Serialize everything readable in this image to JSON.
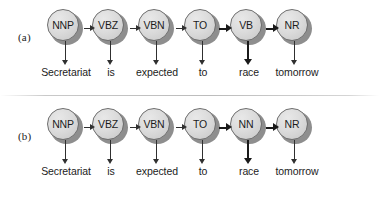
{
  "figure": {
    "background_color": "#ffffff",
    "node_fill_color": "#dcdcdc",
    "node_shadow_color": "#8e8e8e",
    "node_outline_color": "#6e6e6e",
    "arrow_color": "#303030",
    "divider_color": "#bcbcbc"
  },
  "panels": [
    {
      "label": "(a)",
      "nodes": [
        {
          "tag": "NNP",
          "word": "Secretariat",
          "x": 65,
          "word_arrow_bold": false
        },
        {
          "tag": "VBZ",
          "word": "is",
          "x": 110,
          "word_arrow_bold": false
        },
        {
          "tag": "VBN",
          "word": "expected",
          "x": 156,
          "word_arrow_bold": false
        },
        {
          "tag": "TO",
          "word": "to",
          "x": 202,
          "word_arrow_bold": false
        },
        {
          "tag": "VB",
          "word": "race",
          "x": 248,
          "word_arrow_bold": true
        },
        {
          "tag": "NR",
          "word": "tomorrow",
          "x": 294,
          "word_arrow_bold": false
        }
      ],
      "connectors": [
        {
          "from": "NNP",
          "to": "VBZ",
          "bold": false
        },
        {
          "from": "VBZ",
          "to": "VBN",
          "bold": false
        },
        {
          "from": "VBN",
          "to": "TO",
          "bold": false
        },
        {
          "from": "TO",
          "to": "VB",
          "bold": true
        },
        {
          "from": "VB",
          "to": "NR",
          "bold": true
        }
      ]
    },
    {
      "label": "(b)",
      "nodes": [
        {
          "tag": "NNP",
          "word": "Secretariat",
          "x": 65,
          "word_arrow_bold": false
        },
        {
          "tag": "VBZ",
          "word": "is",
          "x": 110,
          "word_arrow_bold": false
        },
        {
          "tag": "VBN",
          "word": "expected",
          "x": 156,
          "word_arrow_bold": false
        },
        {
          "tag": "TO",
          "word": "to",
          "x": 202,
          "word_arrow_bold": false
        },
        {
          "tag": "NN",
          "word": "race",
          "x": 248,
          "word_arrow_bold": true
        },
        {
          "tag": "NR",
          "word": "tomorrow",
          "x": 294,
          "word_arrow_bold": false
        }
      ],
      "connectors": [
        {
          "from": "NNP",
          "to": "VBZ",
          "bold": false
        },
        {
          "from": "VBZ",
          "to": "VBN",
          "bold": false
        },
        {
          "from": "VBN",
          "to": "TO",
          "bold": false
        },
        {
          "from": "TO",
          "to": "NN",
          "bold": true
        },
        {
          "from": "NN",
          "to": "NR",
          "bold": true
        }
      ]
    }
  ]
}
